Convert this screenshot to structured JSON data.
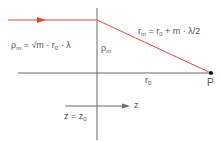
{
  "diagram": {
    "colors": {
      "ray": "#e8463c",
      "axis": "#6a6a6a",
      "text": "#555555",
      "point": "#111111"
    },
    "labels": {
      "rho_formula_lhs": "ρ",
      "rho_formula_lhs_sub": "m",
      "rho_formula_rhs": " = √m · r",
      "rho_formula_rhs_sub": "0",
      "rho_formula_tail": " · λ",
      "rho_m": "ρ",
      "rho_m_sub": "m",
      "r_m_lhs": "r",
      "r_m_lhs_sub": "m",
      "r_m_mid": " = r",
      "r_m_mid_sub": "0",
      "r_m_tail": " + m · λ/2",
      "r0": "r",
      "r0_sub": "0",
      "point": "P",
      "axis": "z",
      "plane_lhs": "z = z",
      "plane_sub": "0"
    }
  }
}
